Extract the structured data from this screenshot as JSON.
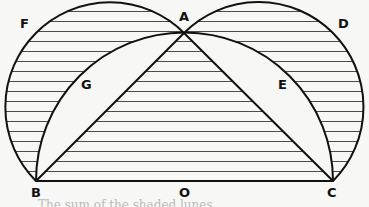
{
  "diagram": {
    "points": {
      "A": "A",
      "B": "B",
      "C": "C",
      "D": "D",
      "E": "E",
      "F": "F",
      "G": "G",
      "O": "O"
    },
    "colors": {
      "stroke": "#111111",
      "background": "#f7f7f5",
      "hatch": "#111111"
    },
    "caption_fragment": "The sum of the shaded lunes ..."
  }
}
